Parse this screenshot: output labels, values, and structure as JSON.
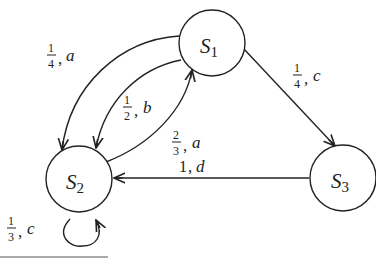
{
  "diagram": {
    "type": "state-transition-diagram",
    "states": [
      {
        "id": "S1",
        "letter": "S",
        "sub": "1"
      },
      {
        "id": "S2",
        "letter": "S",
        "sub": "2"
      },
      {
        "id": "S3",
        "letter": "S",
        "sub": "3"
      }
    ],
    "transitions": [
      {
        "from": "S1",
        "to": "S2",
        "num": "1",
        "den": "4",
        "symbol": "a",
        "route": "outer arc"
      },
      {
        "from": "S1",
        "to": "S2",
        "num": "1",
        "den": "2",
        "symbol": "b",
        "route": "inner arc"
      },
      {
        "from": "S2",
        "to": "S1",
        "num": "2",
        "den": "3",
        "symbol": "a",
        "route": "arc"
      },
      {
        "from": "S1",
        "to": "S3",
        "num": "1",
        "den": "4",
        "symbol": "c",
        "route": "straight"
      },
      {
        "from": "S3",
        "to": "S2",
        "prob": "1",
        "symbol": "d",
        "route": "straight"
      },
      {
        "from": "S2",
        "to": "S2",
        "num": "1",
        "den": "3",
        "symbol": "c",
        "route": "self-loop"
      }
    ],
    "separator": "—"
  }
}
